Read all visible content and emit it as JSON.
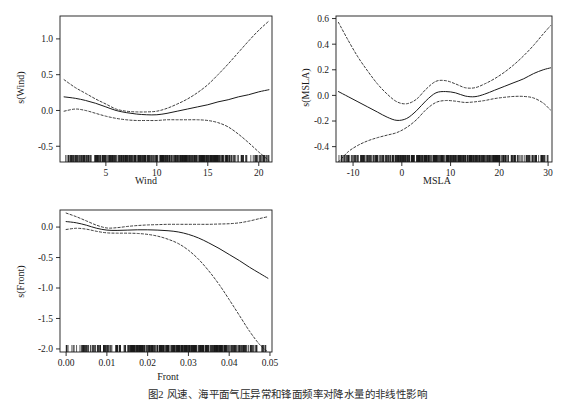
{
  "figure": {
    "caption": "图2 风速、海平面气压异常和锋面频率对降水量的非线性影响",
    "background": "#ffffff",
    "line_color": "#1a1a1a"
  },
  "chart_data": [
    {
      "type": "line",
      "panel_index": 1,
      "title": "",
      "xlabel": "Wind",
      "ylabel": "s(Wind)",
      "xlim": [
        0.5,
        21.3
      ],
      "ylim": [
        -0.72,
        1.32
      ],
      "xticks": [
        5,
        10,
        15,
        20
      ],
      "xticklabels": [
        "5",
        "10",
        "15",
        "20"
      ],
      "yticks": [
        -0.5,
        0.0,
        0.5,
        1.0
      ],
      "yticklabels": [
        "-0.5",
        "0.0",
        "0.5",
        "1.0"
      ],
      "grid": false,
      "legend": null,
      "series": [
        {
          "name": "smooth fit",
          "style": "solid",
          "x": [
            0.9,
            2.0,
            3.0,
            4.0,
            5.0,
            6.0,
            7.0,
            8.0,
            9.0,
            10.0,
            11.0,
            12.0,
            13.0,
            14.0,
            15.0,
            16.0,
            17.0,
            18.0,
            19.0,
            20.0,
            21.0
          ],
          "values": [
            0.19,
            0.17,
            0.14,
            0.1,
            0.05,
            0.0,
            -0.03,
            -0.05,
            -0.06,
            -0.06,
            -0.04,
            -0.01,
            0.02,
            0.05,
            0.08,
            0.12,
            0.15,
            0.19,
            0.22,
            0.26,
            0.29
          ]
        },
        {
          "name": "upper 95% confidence limit",
          "style": "dashed",
          "x": [
            0.9,
            2.0,
            3.0,
            4.0,
            5.0,
            6.0,
            7.0,
            8.0,
            9.0,
            10.0,
            11.0,
            12.0,
            13.0,
            14.0,
            15.0,
            16.0,
            17.0,
            18.0,
            19.0,
            20.0,
            21.0
          ],
          "values": [
            0.43,
            0.32,
            0.24,
            0.16,
            0.09,
            0.02,
            -0.01,
            -0.02,
            -0.02,
            -0.01,
            0.03,
            0.09,
            0.16,
            0.25,
            0.36,
            0.5,
            0.65,
            0.81,
            0.97,
            1.12,
            1.25
          ]
        },
        {
          "name": "lower 95% confidence limit",
          "style": "dashed",
          "x": [
            0.9,
            2.0,
            3.0,
            4.0,
            5.0,
            6.0,
            7.0,
            8.0,
            9.0,
            10.0,
            11.0,
            12.0,
            13.0,
            14.0,
            15.0,
            16.0,
            17.0,
            18.0,
            19.0,
            20.0,
            21.0
          ],
          "values": [
            -0.01,
            0.02,
            0.0,
            -0.04,
            -0.08,
            -0.11,
            -0.13,
            -0.14,
            -0.14,
            -0.14,
            -0.13,
            -0.13,
            -0.13,
            -0.13,
            -0.14,
            -0.17,
            -0.23,
            -0.33,
            -0.45,
            -0.58,
            -0.7
          ]
        }
      ],
      "rug": {
        "axis": "x",
        "description": "dense rug of observations along lower axis",
        "range": [
          0.9,
          21.0
        ],
        "density": "very dense below 16, sparse above"
      }
    },
    {
      "type": "line",
      "panel_index": 2,
      "title": "",
      "xlabel": "MSLA",
      "ylabel": "s(MSLA)",
      "xlim": [
        -13.5,
        30.8
      ],
      "ylim": [
        -0.52,
        0.62
      ],
      "xticks": [
        -10,
        0,
        10,
        20,
        30
      ],
      "xticklabels": [
        "-10",
        "0",
        "10",
        "20",
        "30"
      ],
      "yticks": [
        -0.4,
        -0.2,
        0.0,
        0.2,
        0.4,
        0.6
      ],
      "yticklabels": [
        "-0.4",
        "-0.2",
        "0.0",
        "0.2",
        "0.4",
        "0.6"
      ],
      "grid": false,
      "legend": null,
      "series": [
        {
          "name": "smooth fit",
          "style": "solid",
          "x": [
            -13.0,
            -11.0,
            -9.0,
            -7.0,
            -5.0,
            -3.0,
            -1.0,
            1.0,
            3.0,
            5.0,
            7.0,
            9.0,
            11.0,
            13.0,
            15.0,
            17.0,
            19.0,
            21.0,
            23.0,
            25.0,
            27.0,
            29.0,
            30.5
          ],
          "values": [
            0.03,
            -0.01,
            -0.05,
            -0.09,
            -0.13,
            -0.17,
            -0.195,
            -0.18,
            -0.12,
            -0.04,
            0.02,
            0.03,
            0.02,
            -0.005,
            -0.01,
            0.01,
            0.04,
            0.07,
            0.1,
            0.13,
            0.17,
            0.2,
            0.215
          ]
        },
        {
          "name": "upper 95% confidence limit",
          "style": "dashed",
          "x": [
            -13.0,
            -11.0,
            -9.0,
            -7.0,
            -5.0,
            -3.0,
            -1.0,
            1.0,
            3.0,
            5.0,
            7.0,
            9.0,
            11.0,
            13.0,
            15.0,
            17.0,
            19.0,
            21.0,
            23.0,
            25.0,
            27.0,
            29.0,
            30.5
          ],
          "values": [
            0.57,
            0.43,
            0.3,
            0.19,
            0.09,
            0.01,
            -0.05,
            -0.065,
            -0.03,
            0.05,
            0.11,
            0.115,
            0.09,
            0.06,
            0.06,
            0.09,
            0.13,
            0.18,
            0.24,
            0.31,
            0.39,
            0.48,
            0.545
          ]
        },
        {
          "name": "lower 95% confidence limit",
          "style": "dashed",
          "x": [
            -13.0,
            -11.0,
            -9.0,
            -7.0,
            -5.0,
            -3.0,
            -1.0,
            1.0,
            3.0,
            5.0,
            7.0,
            9.0,
            11.0,
            13.0,
            15.0,
            17.0,
            19.0,
            21.0,
            23.0,
            25.0,
            27.0,
            29.0,
            30.5
          ],
          "values": [
            -0.52,
            -0.44,
            -0.39,
            -0.355,
            -0.33,
            -0.31,
            -0.29,
            -0.25,
            -0.19,
            -0.11,
            -0.055,
            -0.04,
            -0.045,
            -0.055,
            -0.05,
            -0.04,
            -0.025,
            -0.015,
            -0.008,
            -0.008,
            -0.02,
            -0.06,
            -0.115
          ]
        }
      ],
      "rug": {
        "axis": "x",
        "description": "dense rug of observations along lower axis",
        "range": [
          -13.0,
          30.0
        ],
        "density": "sparse below -5, very dense from -5 to 28"
      }
    },
    {
      "type": "line",
      "panel_index": 3,
      "title": "",
      "xlabel": "Front",
      "ylabel": "s(Front)",
      "xlim": [
        -0.0015,
        0.0505
      ],
      "ylim": [
        -2.05,
        0.28
      ],
      "xticks": [
        0.0,
        0.01,
        0.02,
        0.03,
        0.04,
        0.05
      ],
      "xticklabels": [
        "0.00",
        "0.01",
        "0.02",
        "0.03",
        "0.04",
        "0.05"
      ],
      "yticks": [
        -2.0,
        -1.5,
        -1.0,
        -0.5,
        0.0
      ],
      "yticklabels": [
        "-2.0",
        "-1.5",
        "-1.0",
        "-0.5",
        "0.0"
      ],
      "grid": false,
      "legend": null,
      "series": [
        {
          "name": "smooth fit",
          "style": "solid",
          "x": [
            0.0,
            0.0025,
            0.005,
            0.0075,
            0.01,
            0.0125,
            0.015,
            0.0175,
            0.02,
            0.0225,
            0.025,
            0.0275,
            0.03,
            0.0325,
            0.035,
            0.0375,
            0.04,
            0.0425,
            0.045,
            0.0475,
            0.0495
          ],
          "values": [
            0.09,
            0.07,
            0.03,
            -0.02,
            -0.05,
            -0.055,
            -0.05,
            -0.045,
            -0.045,
            -0.05,
            -0.06,
            -0.08,
            -0.12,
            -0.18,
            -0.26,
            -0.35,
            -0.45,
            -0.55,
            -0.66,
            -0.76,
            -0.84
          ]
        },
        {
          "name": "upper 95% confidence limit",
          "style": "dashed",
          "x": [
            0.0,
            0.0025,
            0.005,
            0.0075,
            0.01,
            0.0125,
            0.015,
            0.0175,
            0.02,
            0.0225,
            0.025,
            0.0275,
            0.03,
            0.0325,
            0.035,
            0.0375,
            0.04,
            0.0425,
            0.045,
            0.0475,
            0.0495
          ],
          "values": [
            0.23,
            0.17,
            0.1,
            0.03,
            -0.015,
            -0.01,
            0.01,
            0.025,
            0.035,
            0.04,
            0.045,
            0.045,
            0.045,
            0.045,
            0.045,
            0.05,
            0.055,
            0.07,
            0.1,
            0.14,
            0.17
          ]
        },
        {
          "name": "lower 95% confidence limit",
          "style": "dashed",
          "x": [
            0.0,
            0.0025,
            0.005,
            0.0075,
            0.01,
            0.0125,
            0.015,
            0.0175,
            0.02,
            0.0225,
            0.025,
            0.0275,
            0.03,
            0.0325,
            0.035,
            0.0375,
            0.04,
            0.0425,
            0.045,
            0.0475,
            0.0495
          ],
          "values": [
            -0.04,
            -0.02,
            -0.035,
            -0.07,
            -0.095,
            -0.1,
            -0.1,
            -0.105,
            -0.12,
            -0.15,
            -0.2,
            -0.27,
            -0.38,
            -0.53,
            -0.72,
            -0.94,
            -1.19,
            -1.45,
            -1.71,
            -1.93,
            -2.05
          ]
        }
      ],
      "rug": {
        "axis": "x",
        "description": "dense rug of observations along lower axis",
        "range": [
          0.0,
          0.049
        ],
        "density": "very dense below 0.035, sparse above"
      }
    }
  ]
}
